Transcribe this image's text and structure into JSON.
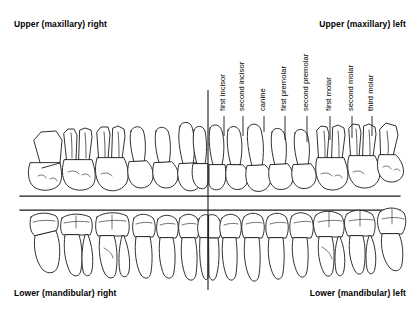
{
  "diagram": {
    "title_quadrants": {
      "upper_right": "Upper (maxillary) right",
      "upper_left": "Upper (maxillary) left",
      "lower_right": "Lower (mandibular) right",
      "lower_left": "Lower (mandibular) left"
    },
    "colors": {
      "ink": "#1a1a1a",
      "background": "#ffffff",
      "shading": "#b8b8b8"
    },
    "tooth_labels": [
      {
        "name": "first incisor",
        "x": 224,
        "label_baseline_y": 112,
        "leader_top": 116,
        "leader_bottom": 136
      },
      {
        "name": "second incisor",
        "x": 243,
        "label_baseline_y": 112,
        "leader_top": 116,
        "leader_bottom": 136
      },
      {
        "name": "canine",
        "x": 264,
        "label_baseline_y": 112,
        "leader_top": 116,
        "leader_bottom": 132
      },
      {
        "name": "first premolar",
        "x": 285,
        "label_baseline_y": 112,
        "leader_top": 116,
        "leader_bottom": 140
      },
      {
        "name": "second premolar",
        "x": 307,
        "label_baseline_y": 112,
        "leader_top": 116,
        "leader_bottom": 142
      },
      {
        "name": "first molar",
        "x": 330,
        "label_baseline_y": 112,
        "leader_top": 116,
        "leader_bottom": 140
      },
      {
        "name": "second molar",
        "x": 352,
        "label_baseline_y": 112,
        "leader_top": 116,
        "leader_bottom": 138
      },
      {
        "name": "third molar",
        "x": 372,
        "label_baseline_y": 112,
        "leader_top": 116,
        "leader_bottom": 136
      }
    ],
    "midline": {
      "x": 208,
      "y_top": 90,
      "y_bottom": 290
    },
    "occlusal_lines": [
      {
        "x1": 20,
        "x2": 400,
        "y": 196
      },
      {
        "x1": 20,
        "x2": 400,
        "y": 210
      }
    ],
    "arches": {
      "upper": {
        "label": "maxillary arch",
        "crown_baseline_y": 190,
        "root_apex_y": 128
      },
      "lower": {
        "label": "mandibular arch",
        "crown_top_y": 214,
        "root_apex_y": 278
      }
    }
  }
}
